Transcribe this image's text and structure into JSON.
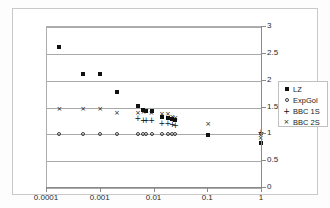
{
  "chart_data": {
    "type": "scatter",
    "title": "",
    "xlabel": "",
    "ylabel": "",
    "xscale": "log",
    "xlim": [
      0.0001,
      1
    ],
    "ylim": [
      0,
      3
    ],
    "grid": true,
    "legend_position": "right",
    "x_ticks": [
      "0.0001",
      "0.001",
      "0.01",
      "0.1",
      "1"
    ],
    "x_tick_values": [
      0.0001,
      0.001,
      0.01,
      0.1,
      1
    ],
    "y_ticks": [
      "0",
      "0.5",
      "1",
      "1.5",
      "2",
      "2.5",
      "3"
    ],
    "y_tick_values": [
      0,
      0.5,
      1,
      1.5,
      2,
      2.5,
      3
    ],
    "series": [
      {
        "name": "LZ",
        "marker": "filled-square",
        "points": [
          [
            0.00017,
            2.63
          ],
          [
            0.00047,
            2.12
          ],
          [
            0.00098,
            2.12
          ],
          [
            0.002,
            1.78
          ],
          [
            0.0049,
            1.53
          ],
          [
            0.0062,
            1.45
          ],
          [
            0.007,
            1.44
          ],
          [
            0.0088,
            1.43
          ],
          [
            0.0137,
            1.33
          ],
          [
            0.0177,
            1.31
          ],
          [
            0.0215,
            1.28
          ],
          [
            0.0245,
            1.26
          ],
          [
            0.1,
            0.99
          ],
          [
            0.95,
            0.83
          ]
        ]
      },
      {
        "name": "ExpGol",
        "marker": "open-circle",
        "points": [
          [
            0.00017,
            1.0
          ],
          [
            0.00047,
            1.0
          ],
          [
            0.00098,
            1.0
          ],
          [
            0.002,
            1.0
          ],
          [
            0.0049,
            1.0
          ],
          [
            0.0062,
            1.0
          ],
          [
            0.007,
            1.0
          ],
          [
            0.0088,
            1.0
          ],
          [
            0.0137,
            1.0
          ],
          [
            0.0177,
            1.0
          ],
          [
            0.0215,
            1.0
          ],
          [
            0.0245,
            1.0
          ],
          [
            0.95,
            1.0
          ]
        ]
      },
      {
        "name": "BBC 1S",
        "marker": "plus",
        "points": [
          [
            0.0049,
            1.3
          ],
          [
            0.0062,
            1.27
          ],
          [
            0.007,
            1.27
          ],
          [
            0.0088,
            1.26
          ],
          [
            0.0137,
            1.22
          ],
          [
            0.0177,
            1.21
          ],
          [
            0.0215,
            1.19
          ],
          [
            0.0245,
            1.17
          ],
          [
            0.95,
            1.05
          ]
        ]
      },
      {
        "name": "BBC 2S",
        "marker": "cross",
        "points": [
          [
            0.00017,
            1.48
          ],
          [
            0.00047,
            1.47
          ],
          [
            0.00098,
            1.47
          ],
          [
            0.002,
            1.4
          ],
          [
            0.0049,
            1.4
          ],
          [
            0.0062,
            1.42
          ],
          [
            0.007,
            1.43
          ],
          [
            0.0088,
            1.4
          ],
          [
            0.0137,
            1.37
          ],
          [
            0.0177,
            1.38
          ],
          [
            0.0215,
            1.33
          ],
          [
            0.0245,
            1.3
          ],
          [
            0.1,
            1.2
          ],
          [
            0.95,
            0.93
          ]
        ]
      }
    ]
  },
  "legend": {
    "items": [
      {
        "label": "LZ",
        "marker": "filled-square"
      },
      {
        "label": "ExpGol",
        "marker": "open-circle"
      },
      {
        "label": "BBC 1S",
        "marker": "plus"
      },
      {
        "label": "BBC 2S",
        "marker": "cross"
      }
    ]
  },
  "colors": {
    "series": "#111111",
    "grid": "#a9a9a9",
    "axis": "#8a8a8a",
    "frame": "#c9c9c9",
    "background": "#ffffff"
  }
}
